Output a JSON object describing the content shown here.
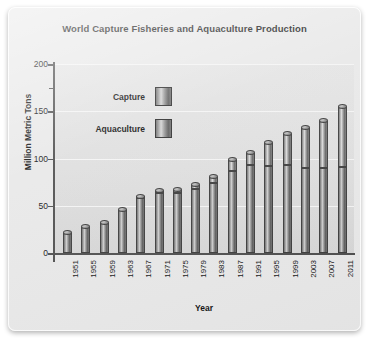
{
  "chart_data": {
    "type": "bar",
    "title": "World Capture Fisheries and Aquaculture Production",
    "xlabel": "Year",
    "ylabel": "Million Metric Tons",
    "ylim": [
      0,
      200
    ],
    "yticks": [
      0,
      50,
      100,
      150,
      200
    ],
    "grid": true,
    "stacked": true,
    "legend_position": "upper-left-inside",
    "categories": [
      "1951",
      "1955",
      "1959",
      "1963",
      "1967",
      "1971",
      "1975",
      "1979",
      "1983",
      "1987",
      "1991",
      "1995",
      "1999",
      "2003",
      "2007",
      "2011"
    ],
    "series": [
      {
        "name": "Capture",
        "values": [
          21,
          28,
          32,
          45,
          58,
          64,
          64,
          68,
          74,
          87,
          93,
          92,
          93,
          90,
          90,
          91
        ]
      },
      {
        "name": "Aquaculture",
        "values": [
          0,
          0,
          0,
          0,
          1,
          2,
          3,
          4,
          6,
          11,
          13,
          24,
          33,
          42,
          50,
          64
        ]
      }
    ],
    "totals": [
      21,
      28,
      32,
      45,
      59,
      66,
      67,
      72,
      80,
      98,
      106,
      116,
      126,
      132,
      140,
      155
    ]
  },
  "legend": {
    "items": [
      {
        "label": "Capture",
        "swatch": "cylinder-gradient-dark"
      },
      {
        "label": "Aquaculture",
        "swatch": "cylinder-gradient-light"
      }
    ]
  }
}
